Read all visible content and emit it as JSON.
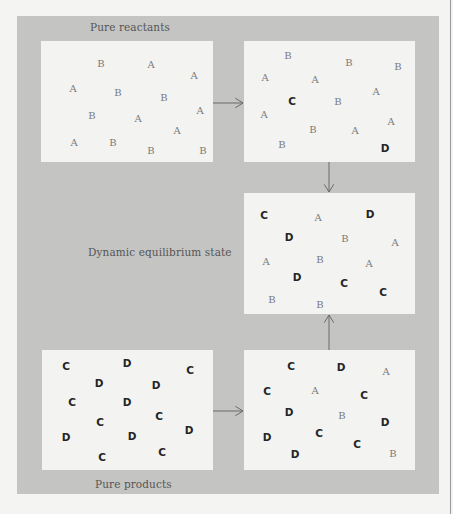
{
  "labels": {
    "pure_reactants": "Pure reactants",
    "equilibrium": "Dynamic equilibrium state",
    "pure_products": "Pure products"
  },
  "colors": {
    "panel": "#c4c4c3",
    "box": "#f3f3f2",
    "reactant_glyph": "#7a7a7a",
    "product_glyph": "#252525",
    "arrow": "#6a6a6a"
  },
  "boxes": [
    {
      "id": "pure-reactants",
      "rect": [
        41,
        41,
        172,
        121
      ],
      "molecules": [
        {
          "s": "B",
          "x": 60,
          "y": 23
        },
        {
          "s": "A",
          "x": 110,
          "y": 24
        },
        {
          "s": "A",
          "x": 153,
          "y": 35
        },
        {
          "s": "A",
          "x": 32,
          "y": 48
        },
        {
          "s": "B",
          "x": 77,
          "y": 52
        },
        {
          "s": "B",
          "x": 123,
          "y": 57
        },
        {
          "s": "B",
          "x": 51,
          "y": 75
        },
        {
          "s": "A",
          "x": 97,
          "y": 78
        },
        {
          "s": "A",
          "x": 159,
          "y": 70
        },
        {
          "s": "A",
          "x": 136,
          "y": 90
        },
        {
          "s": "A",
          "x": 33,
          "y": 102
        },
        {
          "s": "B",
          "x": 72,
          "y": 102
        },
        {
          "s": "B",
          "x": 110,
          "y": 110
        },
        {
          "s": "B",
          "x": 162,
          "y": 110
        }
      ]
    },
    {
      "id": "early-reaction",
      "rect": [
        244,
        41,
        171,
        121
      ],
      "molecules": [
        {
          "s": "B",
          "x": 44,
          "y": 15
        },
        {
          "s": "B",
          "x": 105,
          "y": 22
        },
        {
          "s": "B",
          "x": 154,
          "y": 26
        },
        {
          "s": "A",
          "x": 21,
          "y": 37
        },
        {
          "s": "A",
          "x": 71,
          "y": 39
        },
        {
          "s": "A",
          "x": 132,
          "y": 51
        },
        {
          "s": "C",
          "x": 48,
          "y": 60
        },
        {
          "s": "B",
          "x": 94,
          "y": 61
        },
        {
          "s": "A",
          "x": 20,
          "y": 74
        },
        {
          "s": "B",
          "x": 69,
          "y": 89
        },
        {
          "s": "A",
          "x": 111,
          "y": 90
        },
        {
          "s": "A",
          "x": 147,
          "y": 81
        },
        {
          "s": "B",
          "x": 38,
          "y": 104
        },
        {
          "s": "D",
          "x": 141,
          "y": 107
        }
      ]
    },
    {
      "id": "dynamic-equilibrium",
      "rect": [
        244,
        193,
        171,
        121
      ],
      "molecules": [
        {
          "s": "C",
          "x": 20,
          "y": 22
        },
        {
          "s": "A",
          "x": 74,
          "y": 25
        },
        {
          "s": "D",
          "x": 126,
          "y": 21
        },
        {
          "s": "D",
          "x": 45,
          "y": 44
        },
        {
          "s": "B",
          "x": 101,
          "y": 46
        },
        {
          "s": "A",
          "x": 151,
          "y": 50
        },
        {
          "s": "A",
          "x": 22,
          "y": 69
        },
        {
          "s": "B",
          "x": 76,
          "y": 67
        },
        {
          "s": "A",
          "x": 125,
          "y": 71
        },
        {
          "s": "D",
          "x": 53,
          "y": 84
        },
        {
          "s": "C",
          "x": 100,
          "y": 90
        },
        {
          "s": "C",
          "x": 139,
          "y": 99
        },
        {
          "s": "B",
          "x": 28,
          "y": 107
        },
        {
          "s": "B",
          "x": 76,
          "y": 112
        }
      ]
    },
    {
      "id": "pure-products",
      "rect": [
        42,
        350,
        171,
        120
      ],
      "molecules": [
        {
          "s": "C",
          "x": 24,
          "y": 16
        },
        {
          "s": "D",
          "x": 85,
          "y": 13
        },
        {
          "s": "C",
          "x": 148,
          "y": 20
        },
        {
          "s": "D",
          "x": 57,
          "y": 33
        },
        {
          "s": "D",
          "x": 114,
          "y": 35
        },
        {
          "s": "C",
          "x": 30,
          "y": 52
        },
        {
          "s": "D",
          "x": 85,
          "y": 52
        },
        {
          "s": "C",
          "x": 58,
          "y": 72
        },
        {
          "s": "C",
          "x": 117,
          "y": 66
        },
        {
          "s": "D",
          "x": 24,
          "y": 87
        },
        {
          "s": "D",
          "x": 90,
          "y": 86
        },
        {
          "s": "D",
          "x": 147,
          "y": 80
        },
        {
          "s": "C",
          "x": 60,
          "y": 107
        },
        {
          "s": "C",
          "x": 120,
          "y": 102
        }
      ]
    },
    {
      "id": "early-reverse-reaction",
      "rect": [
        244,
        350,
        171,
        120
      ],
      "molecules": [
        {
          "s": "C",
          "x": 47,
          "y": 16
        },
        {
          "s": "D",
          "x": 97,
          "y": 17
        },
        {
          "s": "A",
          "x": 142,
          "y": 22
        },
        {
          "s": "C",
          "x": 23,
          "y": 41
        },
        {
          "s": "A",
          "x": 71,
          "y": 41
        },
        {
          "s": "C",
          "x": 120,
          "y": 45
        },
        {
          "s": "D",
          "x": 45,
          "y": 62
        },
        {
          "s": "B",
          "x": 98,
          "y": 66
        },
        {
          "s": "D",
          "x": 141,
          "y": 72
        },
        {
          "s": "C",
          "x": 75,
          "y": 83
        },
        {
          "s": "D",
          "x": 23,
          "y": 87
        },
        {
          "s": "C",
          "x": 113,
          "y": 94
        },
        {
          "s": "D",
          "x": 51,
          "y": 104
        },
        {
          "s": "B",
          "x": 149,
          "y": 104
        }
      ]
    }
  ],
  "arrows": [
    {
      "id": "reactants-to-early",
      "from": [
        213,
        103
      ],
      "to": [
        243,
        103
      ]
    },
    {
      "id": "early-to-equilibrium",
      "from": [
        329,
        162
      ],
      "to": [
        329,
        192
      ]
    },
    {
      "id": "products-to-reverse",
      "from": [
        213,
        411
      ],
      "to": [
        243,
        411
      ]
    },
    {
      "id": "reverse-to-equilibrium",
      "from": [
        329,
        350
      ],
      "to": [
        329,
        315
      ]
    }
  ]
}
